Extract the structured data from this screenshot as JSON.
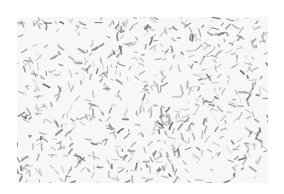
{
  "image": {
    "description": "Grayscale speckled texture of short scattered dark strokes on a white background",
    "background_color": "#ffffff",
    "texture_fill": "#f7f7f7",
    "stroke_colors": [
      "#555555",
      "#777777",
      "#999999",
      "#bbbbbb"
    ],
    "bounds": {
      "x": 17,
      "y": 17,
      "width": 251,
      "height": 166
    },
    "stroke_count": 700,
    "seed": 7
  }
}
